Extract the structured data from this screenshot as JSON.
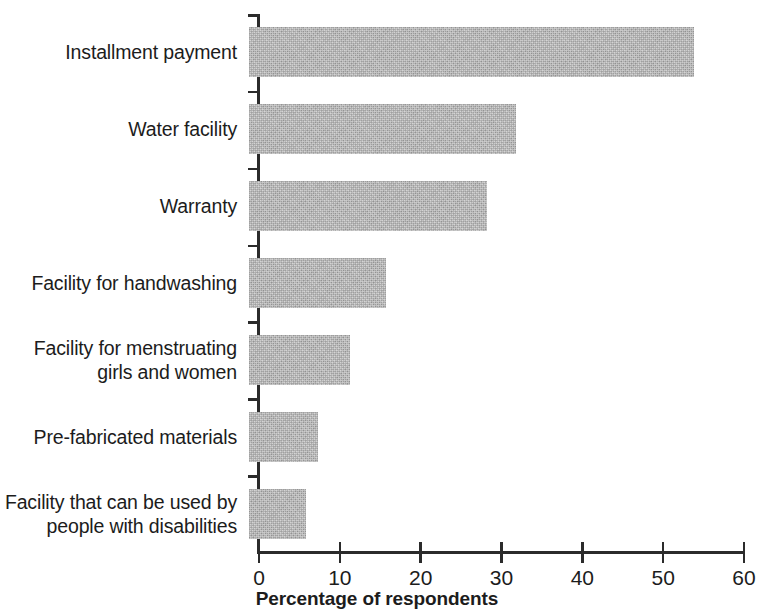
{
  "chart_data": {
    "type": "bar",
    "orientation": "horizontal",
    "title": "",
    "xlabel": "Percentage of respondents",
    "ylabel": "",
    "xlim": [
      0,
      60
    ],
    "xticks": [
      0,
      10,
      20,
      30,
      40,
      50,
      60
    ],
    "xtick_labels": [
      "0",
      "10",
      "20",
      "30",
      "40",
      "50",
      "60"
    ],
    "grid": false,
    "legend": null,
    "bar_color": "#b2b2b2",
    "axis_color": "#2b2b2b",
    "categories": [
      "Installment payment",
      "Water facility",
      "Warranty",
      "Facility for handwashing",
      "Facility for menstruating\ngirls and women",
      "Pre-fabricated materials",
      "Facility that can be used by\npeople with disabilities"
    ],
    "values": [
      55,
      33,
      29.5,
      17,
      12.5,
      8.5,
      7
    ],
    "series": [
      {
        "name": "Percentage of respondents",
        "values": [
          55,
          33,
          29.5,
          17,
          12.5,
          8.5,
          7
        ]
      }
    ]
  }
}
